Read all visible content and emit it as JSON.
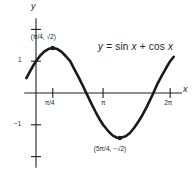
{
  "chart_data": {
    "type": "line",
    "title": "",
    "equation_label": "y = sin x + cos x",
    "xlabel": "x",
    "ylabel": "y",
    "xlim": [
      -0.55,
      6.9
    ],
    "ylim": [
      -2.35,
      2.35
    ],
    "grid": false,
    "legend_position": "none",
    "x_ticks": [
      {
        "value": 0.7853981634,
        "label": "π/4"
      },
      {
        "value": 3.1415926536,
        "label": "π"
      },
      {
        "value": 6.2831853072,
        "label": "2π"
      }
    ],
    "y_ticks": [
      {
        "value": 1,
        "label": "1"
      },
      {
        "value": -1,
        "label": "−1"
      },
      {
        "value": 2,
        "label": ""
      },
      {
        "value": -2,
        "label": ""
      }
    ],
    "annotations": [
      {
        "name": "maximum",
        "x": 0.7853981634,
        "y": 1.4142135624,
        "label": "(π/4, √2)",
        "marker": true
      },
      {
        "name": "minimum",
        "x": 3.926990817,
        "y": -1.4142135624,
        "label": "(5π/4, −√2)",
        "marker": true
      }
    ],
    "series": [
      {
        "name": "y = sin x + cos x",
        "x": [
          -0.45,
          -0.3,
          -0.15,
          0,
          0.2,
          0.4,
          0.6,
          0.7854,
          1.0,
          1.2,
          1.4,
          1.6,
          1.8,
          2.0,
          2.2,
          2.4,
          2.356,
          2.6,
          2.8,
          3.0,
          3.1416,
          3.4,
          3.6,
          3.8,
          3.927,
          4.2,
          4.4,
          4.6,
          4.8,
          5.0,
          5.2,
          5.4,
          5.497,
          5.7,
          5.9,
          6.1,
          6.2832,
          6.45
        ],
        "y": [
          0.466,
          0.659,
          0.84,
          1.0,
          1.178,
          1.31,
          1.39,
          1.41421,
          1.381,
          1.294,
          1.155,
          1.0,
          0.746,
          0.493,
          0.219,
          -0.066,
          0.0,
          -0.341,
          -0.606,
          -0.849,
          -1.0,
          -1.212,
          -1.341,
          -1.408,
          -1.41421,
          -1.36,
          -1.258,
          -1.092,
          -0.897,
          -0.675,
          -0.42,
          -0.14,
          0.0,
          0.304,
          0.552,
          0.793,
          1.0,
          1.139
        ]
      }
    ]
  }
}
